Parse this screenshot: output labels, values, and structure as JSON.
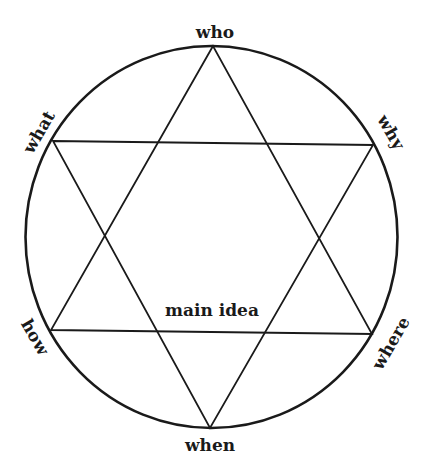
{
  "diagram": {
    "type": "hexagram-in-circle",
    "center_label": "main idea",
    "labels": {
      "top": "who",
      "upper_left": "what",
      "upper_right": "why",
      "lower_left": "how",
      "lower_right": "where",
      "bottom": "when"
    },
    "colors": {
      "stroke": "#1a1a1a",
      "background": "#ffffff"
    }
  }
}
